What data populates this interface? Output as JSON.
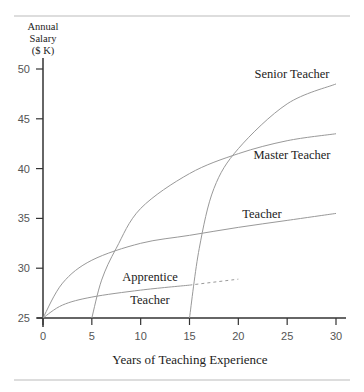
{
  "chart_data": {
    "type": "line",
    "title": "",
    "xlabel": "Years of Teaching Experience",
    "ylabel": "Annual Salary ($ K)",
    "ylabel_lines": [
      "Annual",
      "Salary",
      "($ K)"
    ],
    "xlim": [
      0,
      30
    ],
    "ylim": [
      25,
      50
    ],
    "xticks": [
      0,
      5,
      10,
      15,
      20,
      25,
      30
    ],
    "yticks": [
      25,
      30,
      35,
      40,
      45,
      50
    ],
    "grid": false,
    "series": [
      {
        "name": "Apprentice Teacher",
        "label_lines": [
          "Apprentice",
          "Teacher"
        ],
        "x": [
          0,
          2,
          5,
          10,
          15
        ],
        "y": [
          25,
          26.3,
          27.1,
          27.8,
          28.3
        ],
        "dashed_extension": {
          "x": [
            15,
            20
          ],
          "y": [
            28.3,
            28.9
          ]
        }
      },
      {
        "name": "Teacher",
        "x": [
          0,
          2,
          5,
          10,
          15,
          20,
          25,
          30
        ],
        "y": [
          25,
          28.5,
          30.8,
          32.5,
          33.3,
          34.1,
          34.8,
          35.5
        ]
      },
      {
        "name": "Master Teacher",
        "x": [
          5,
          6,
          7.5,
          10,
          15,
          20,
          25,
          30
        ],
        "y": [
          25,
          28.8,
          32,
          36,
          39.5,
          41.5,
          42.8,
          43.5
        ]
      },
      {
        "name": "Senior Teacher",
        "x": [
          15,
          16,
          17.5,
          20,
          25,
          30
        ],
        "y": [
          25,
          32,
          38,
          42,
          46.5,
          48.5
        ]
      }
    ]
  }
}
